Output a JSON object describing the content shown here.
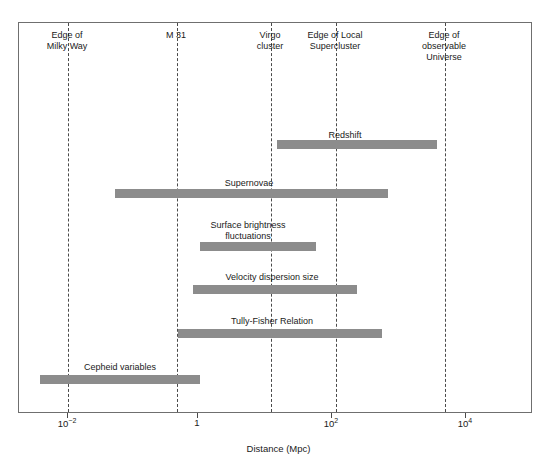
{
  "chart_data": {
    "type": "bar",
    "orientation": "horizontal-range",
    "title": "",
    "xlabel": "Distance (Mpc)",
    "ylabel": "",
    "xscale": "log",
    "xlim": [
      0.00251,
      100000
    ],
    "grid": false,
    "legend": "none",
    "bar_color": "#8c8c8c",
    "x_ticks": [
      {
        "value": 0.01,
        "label": "10",
        "exponent": "−2"
      },
      {
        "value": 1,
        "label": "1",
        "exponent": ""
      },
      {
        "value": 100,
        "label": "10",
        "exponent": "2"
      },
      {
        "value": 10000,
        "label": "10",
        "exponent": "4"
      }
    ],
    "reference_lines": [
      {
        "label": "Edge of\nMilky Way",
        "value": 0.01,
        "px": 67
      },
      {
        "label": "M 31",
        "value": 0.7,
        "px": 176
      },
      {
        "label": "Virgo\ncluster",
        "value": 13,
        "px": 270
      },
      {
        "label": "Edge of Local\nSupercluster",
        "value": 120,
        "px": 335
      },
      {
        "label": "Edge of\nobservable\nUniverse",
        "value": 4000,
        "px": 444
      }
    ],
    "series": [
      {
        "name": "Redshift",
        "start_value": 5,
        "end_value": 4000,
        "start_px": 277,
        "end_px": 437,
        "label_px": 345,
        "label_y": 130,
        "bar_y": 140
      },
      {
        "name": "Supernovae",
        "start_value": 0.07,
        "end_value": 850,
        "start_px": 115,
        "end_px": 388,
        "label_px": 249,
        "label_y": 178,
        "bar_y": 189
      },
      {
        "name": "Surface brightness\nfluctuations",
        "start_value": 1.1,
        "end_value": 55,
        "start_px": 200,
        "end_px": 316,
        "label_px": 248,
        "label_y": 220,
        "bar_y": 242
      },
      {
        "name": "Velocity dispersion size",
        "start_value": 0.85,
        "end_value": 220,
        "start_px": 193,
        "end_px": 357,
        "label_px": 272,
        "label_y": 272,
        "bar_y": 285
      },
      {
        "name": "Tully-Fisher Relation",
        "start_value": 0.6,
        "end_value": 640,
        "start_px": 178,
        "end_px": 382,
        "label_px": 272,
        "label_y": 316,
        "bar_y": 329
      },
      {
        "name": "Cepheid variables",
        "start_value": 0.0044,
        "end_value": 1.1,
        "start_px": 40,
        "end_px": 200,
        "label_px": 120,
        "label_y": 362,
        "bar_y": 375
      }
    ]
  }
}
